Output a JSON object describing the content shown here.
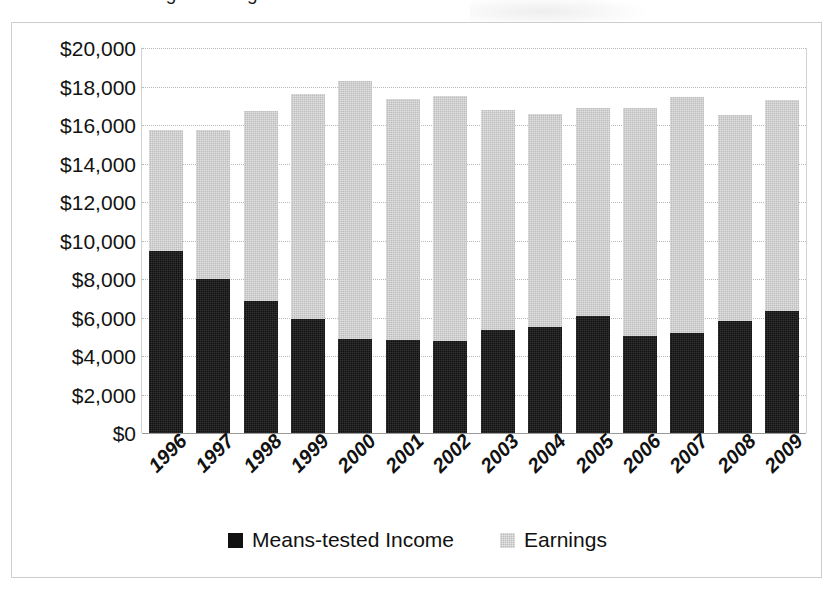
{
  "title_cut_off": "Exhibit 4. Average Earnings and Means-tested Income",
  "legend": {
    "position": "bottom-center",
    "items": [
      {
        "label": "Means-tested Income",
        "color": "#111111",
        "swatch": "means"
      },
      {
        "label": "Earnings",
        "color": "#bdbdbd",
        "swatch": "earnings"
      }
    ]
  },
  "axis": {
    "y_ticks": [
      "$20,000",
      "$18,000",
      "$16,000",
      "$14,000",
      "$12,000",
      "$10,000",
      "$8,000",
      "$6,000",
      "$4,000",
      "$2,000",
      "$0"
    ],
    "x_ticks": [
      "1996",
      "1997",
      "1998",
      "1999",
      "2000",
      "2001",
      "2002",
      "2003",
      "2004",
      "2005",
      "2006",
      "2007",
      "2008",
      "2009"
    ]
  },
  "chart_data": {
    "type": "bar",
    "stacked": true,
    "title": "Exhibit 4. Average Earnings and Means-tested Income",
    "xlabel": "",
    "ylabel": "",
    "ylim": [
      0,
      20000
    ],
    "ytick_step": 2000,
    "grid": true,
    "legend_position": "bottom-center",
    "categories": [
      "1996",
      "1997",
      "1998",
      "1999",
      "2000",
      "2001",
      "2002",
      "2003",
      "2004",
      "2005",
      "2006",
      "2007",
      "2008",
      "2009"
    ],
    "series": [
      {
        "name": "Means-tested Income",
        "color": "#111111",
        "values": [
          9450,
          8000,
          6850,
          5900,
          4900,
          4850,
          4800,
          5350,
          5500,
          6100,
          5050,
          5200,
          5800,
          6350
        ]
      },
      {
        "name": "Earnings",
        "color": "#bdbdbd",
        "values": [
          6300,
          7750,
          9900,
          11700,
          13400,
          12500,
          12700,
          11450,
          11050,
          10800,
          11850,
          12250,
          10700,
          10950
        ]
      }
    ],
    "totals": [
      15750,
      15750,
      16750,
      17600,
      18300,
      17350,
      17500,
      16800,
      16550,
      16900,
      16900,
      17450,
      16500,
      17300
    ]
  }
}
